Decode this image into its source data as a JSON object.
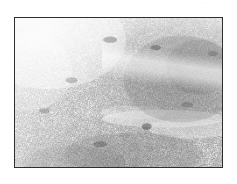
{
  "page": {
    "background_color": "#ffffff",
    "width": 237,
    "height": 184,
    "margin_mark_text": "····  ·· ·"
  },
  "figure": {
    "name": "micrograph",
    "type": "grayscale-micrograph",
    "caption": "",
    "frame": {
      "x": 14,
      "y": 17,
      "width": 209,
      "height": 151,
      "border_color": "#2e2e2e",
      "border_width_px": 1
    },
    "image": {
      "description": "Speckled granular grayscale texture, sparse and light in the upper-left, progressively denser and darker toward the right and lower edges, with a lighter horizontal band crossing the lower-right quadrant.",
      "background_color": "#fcfcfc",
      "speckle_color": "#3a3a3a",
      "mid_tone_color": "#8c8c8c",
      "highlight_color": "#ffffff",
      "density_regions": [
        {
          "region": "upper-left",
          "density": "low",
          "tone": "light"
        },
        {
          "region": "upper-center",
          "density": "medium",
          "tone": "light-mid"
        },
        {
          "region": "right",
          "density": "high",
          "tone": "dark"
        },
        {
          "region": "lower-center",
          "density": "high",
          "tone": "mid-dark"
        },
        {
          "region": "lower-right-band",
          "density": "low",
          "tone": "light"
        }
      ],
      "grain_seed": 20473,
      "speckle_count": 2600
    }
  }
}
